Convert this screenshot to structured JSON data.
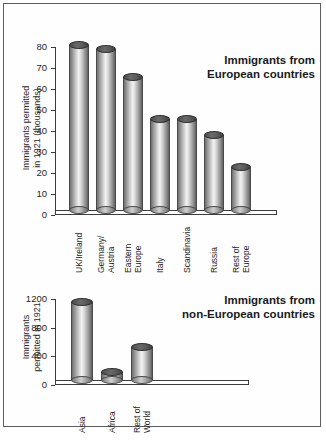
{
  "figure": {
    "background_color": "#ffffff",
    "frame_color": "#5d5d5d",
    "bar_fill_color": "#b9b9b9",
    "bar_top_color": "#4b4b4b",
    "axis_color": "#3a3a3a"
  },
  "chart_data": [
    {
      "type": "bar",
      "title": "Immigrants from European countries",
      "title_line1": "Immigrants from",
      "title_line2": "European countries",
      "xlabel": "",
      "ylabel": "Immigrants permitted in 1921 (thousands)",
      "ylabel_line1": "Immigrants permitted",
      "ylabel_line2": "in 1921 (thousands)",
      "ylim": [
        0,
        80
      ],
      "yticks": [
        0,
        10,
        20,
        30,
        40,
        50,
        60,
        70,
        80
      ],
      "ytick_labels": [
        "0",
        "10",
        "20",
        "30",
        "40",
        "50",
        "60",
        "70",
        "80"
      ],
      "grid": false,
      "legend": "none",
      "categories": [
        "UK/Ireland",
        "Germany/ Austria",
        "Eastern Europe",
        "Italy",
        "Scandinavia",
        "Russia",
        "Rest of Europe"
      ],
      "category_lines": [
        [
          "UK/Ireland"
        ],
        [
          "Germany/",
          "Austria"
        ],
        [
          "Eastern",
          "Europe"
        ],
        [
          "Italy"
        ],
        [
          "Scandinavia"
        ],
        [
          "Russia"
        ],
        [
          "Rest of",
          "Europe"
        ]
      ],
      "values": [
        79,
        77,
        64,
        44,
        44,
        36,
        21
      ]
    },
    {
      "type": "bar",
      "title": "Immigrants from non-European countries",
      "title_line1": "Immigrants from",
      "title_line2": "non-European countries",
      "xlabel": "",
      "ylabel": "Immigrants permitted in 1921",
      "ylabel_line1": "Immigrants",
      "ylabel_line2": "permitted in 1921",
      "ylim": [
        0,
        1200
      ],
      "yticks": [
        0,
        400,
        800,
        1200
      ],
      "ytick_labels": [
        "0",
        "400",
        "800",
        "1200"
      ],
      "grid": false,
      "legend": "none",
      "categories": [
        "Asia",
        "Africa",
        "Rest of World"
      ],
      "category_lines": [
        [
          "Asia"
        ],
        [
          "Africa"
        ],
        [
          "Rest of",
          "World"
        ]
      ],
      "values": [
        1100,
        120,
        480
      ]
    }
  ]
}
